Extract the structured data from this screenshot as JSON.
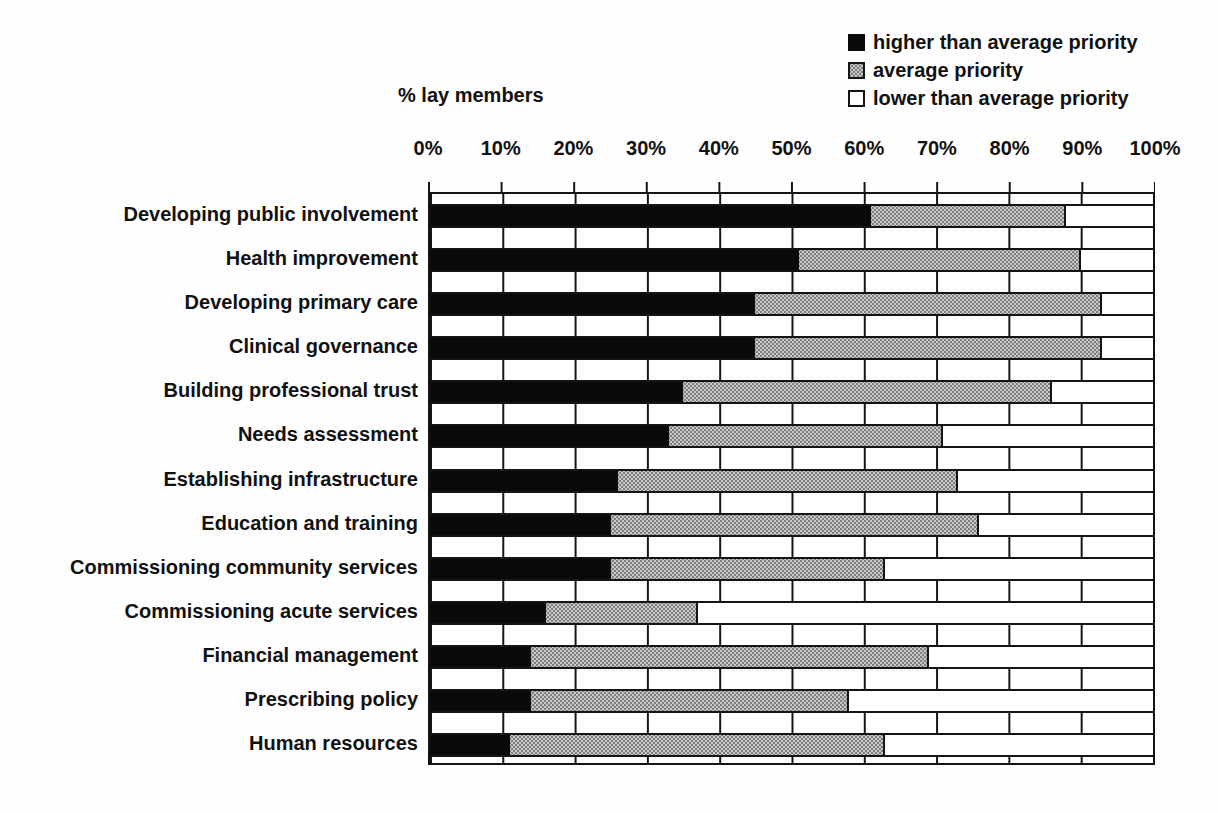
{
  "axis_title": "% lay members",
  "legend": {
    "items": [
      {
        "label": "higher than average priority",
        "swatch_color": "#000000",
        "swatch_style": "solid-black"
      },
      {
        "label": "average priority",
        "swatch_color": "#b8b8b8",
        "swatch_style": "stippled-gray"
      },
      {
        "label": "lower than average priority",
        "swatch_color": "#ffffff",
        "swatch_style": "white-outline"
      }
    ]
  },
  "chart_data": {
    "type": "bar",
    "orientation": "horizontal",
    "stacked": true,
    "title": "",
    "xlabel": "% lay members",
    "ylabel": "",
    "xlim": [
      0,
      100
    ],
    "x_ticks": [
      "0%",
      "10%",
      "20%",
      "30%",
      "40%",
      "50%",
      "60%",
      "70%",
      "80%",
      "90%",
      "100%"
    ],
    "grid": "vertical",
    "legend_position": "top-right",
    "categories": [
      "Developing public involvement",
      "Health improvement",
      "Developing primary care",
      "Clinical governance",
      "Building professional trust",
      "Needs assessment",
      "Establishing infrastructure",
      "Education and training",
      "Commissioning community services",
      "Commissioning acute services",
      "Financial management",
      "Prescribing policy",
      "Human resources"
    ],
    "series": [
      {
        "name": "higher than average priority",
        "color": "#000000",
        "values": [
          61,
          51,
          45,
          45,
          35,
          33,
          26,
          25,
          25,
          16,
          14,
          14,
          11
        ]
      },
      {
        "name": "average priority",
        "color": "#b8b8b8",
        "values": [
          27,
          39,
          48,
          48,
          51,
          38,
          47,
          51,
          38,
          21,
          55,
          44,
          52
        ]
      },
      {
        "name": "lower than average priority",
        "color": "#ffffff",
        "values": [
          12,
          10,
          7,
          7,
          14,
          29,
          27,
          24,
          37,
          63,
          31,
          42,
          37
        ]
      }
    ]
  }
}
